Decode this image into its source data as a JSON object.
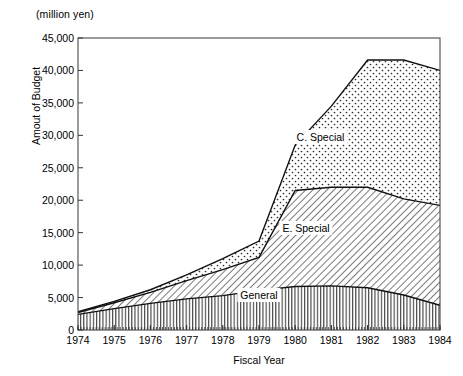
{
  "chart_data": {
    "type": "area",
    "stacked": true,
    "title": "",
    "unit_header": "(million yen)",
    "xlabel": "Fiscal Year",
    "ylabel": "Amout of Budget",
    "x": [
      1974,
      1975,
      1976,
      1977,
      1978,
      1979,
      1980,
      1981,
      1982,
      1983,
      1984
    ],
    "xtick_labels": [
      "1974",
      "1975",
      "1976",
      "1977",
      "1978",
      "1979",
      "1980",
      "1981",
      "1982",
      "1983",
      "1984"
    ],
    "ylim": [
      0,
      45000
    ],
    "ytick_labels": [
      "0",
      "5,000",
      "10,000",
      "15,000",
      "20,000",
      "25,000",
      "30,000",
      "35,000",
      "40,000",
      "45,000"
    ],
    "ytick_values": [
      0,
      5000,
      10000,
      15000,
      20000,
      25000,
      30000,
      35000,
      40000,
      45000
    ],
    "grid": false,
    "legend_position": "inline-annotations",
    "series": [
      {
        "name": "General",
        "pattern": "vertical-lines",
        "values": [
          2400,
          3300,
          4100,
          4800,
          5300,
          6100,
          6700,
          6800,
          6500,
          5400,
          3800
        ]
      },
      {
        "name": "E. Special",
        "pattern": "diagonal-hatch",
        "values": [
          300,
          900,
          1700,
          2800,
          4000,
          5100,
          14800,
          15200,
          15500,
          14800,
          15400
        ]
      },
      {
        "name": "C. Special",
        "pattern": "dots",
        "values": [
          100,
          200,
          400,
          900,
          1700,
          2500,
          7000,
          12500,
          19600,
          21400,
          20800
        ]
      }
    ],
    "cumulative_totals": [
      2800,
      4400,
      6200,
      8500,
      11000,
      13700,
      28500,
      34500,
      41600,
      41600,
      40000
    ],
    "annotations": [
      {
        "text": "C. Special",
        "x_frac": 0.67,
        "y_frac": 0.66
      },
      {
        "text": "E. Special",
        "x_frac": 0.63,
        "y_frac": 0.35
      },
      {
        "text": "General",
        "x_frac": 0.5,
        "y_frac": 0.12
      }
    ],
    "colors": {
      "axis": "#1a1a1a",
      "line": "#111111",
      "fill": "#ffffff",
      "pattern": "#2b2b2b",
      "background": "#ffffff"
    }
  }
}
